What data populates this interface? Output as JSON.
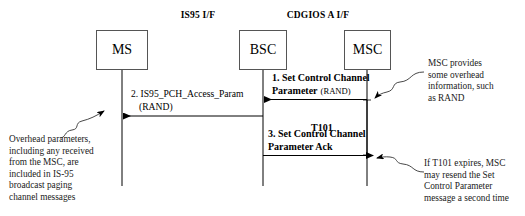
{
  "diagram": {
    "type": "sequence-diagram",
    "interfaces": [
      {
        "id": "is95",
        "label": "IS95 I/F"
      },
      {
        "id": "cdgios-a",
        "label": "CDGIOS A I/F"
      }
    ],
    "nodes": [
      {
        "id": "ms",
        "label": "MS"
      },
      {
        "id": "bsc",
        "label": "BSC"
      },
      {
        "id": "msc",
        "label": "MSC"
      }
    ],
    "messages": [
      {
        "id": "msg1",
        "number": "1.",
        "line1": "1. Set Control Channel",
        "line2": "Parameter",
        "param": "(RAND)",
        "direction": "msc-to-bsc"
      },
      {
        "id": "msg2",
        "number": "2.",
        "line1": "2. IS95_PCH_Access_Param",
        "line2": "(RAND)",
        "direction": "bsc-to-ms"
      },
      {
        "id": "msg3",
        "number": "3.",
        "line1": "3. Set Control Channel",
        "line2": "Parameter Ack",
        "direction": "bsc-to-msc"
      }
    ],
    "timer": {
      "id": "t101",
      "label": "T101"
    },
    "notes": [
      {
        "id": "note-msc-overhead",
        "lines": [
          "MSC provides",
          "some overhead",
          "information, such",
          "as RAND"
        ]
      },
      {
        "id": "note-overhead-params",
        "lines": [
          "Overhead parameters,",
          "including any received",
          "from the MSC, are",
          "included in IS-95",
          "broadcast paging",
          "channel messages"
        ]
      },
      {
        "id": "note-t101-expiry",
        "lines": [
          "If T101 expires, MSC",
          "may resend the Set",
          "Control Parameter",
          "message a second time"
        ]
      }
    ],
    "colors": {
      "line": "#000000",
      "box_border": "#555555",
      "background": "#ffffff",
      "text": "#000000"
    }
  }
}
